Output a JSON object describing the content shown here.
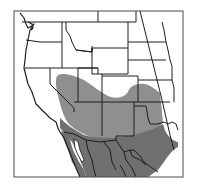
{
  "map": {
    "type": "range-map",
    "region": "Western North America",
    "frame": {
      "x": 14,
      "y": 11,
      "width": 169,
      "height": 166
    },
    "colors": {
      "background": "#ffffff",
      "land": "#ffffff",
      "borders": "#1e1e1e",
      "range_light": "#8f8f8f",
      "range_dark": "#707070",
      "frame": "#4a4a4a"
    },
    "layers": [
      {
        "name": "range-light",
        "shade": "light gray",
        "description": "northern portion of distribution"
      },
      {
        "name": "range-dark",
        "shade": "dark gray",
        "description": "southern portion of distribution"
      }
    ]
  }
}
